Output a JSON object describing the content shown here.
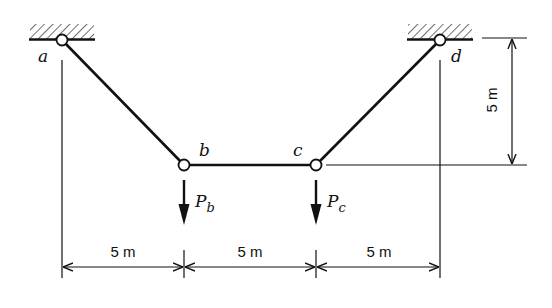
{
  "diagram": {
    "type": "cable-structure",
    "nodes": {
      "a": {
        "label": "a"
      },
      "b": {
        "label": "b"
      },
      "c": {
        "label": "c"
      },
      "d": {
        "label": "d"
      }
    },
    "loads": {
      "pb": {
        "symbol": "P",
        "subscript": "b"
      },
      "pc": {
        "symbol": "P",
        "subscript": "c"
      }
    },
    "dimensions": {
      "span1": "5 m",
      "span2": "5 m",
      "span3": "5 m",
      "height": "5 m"
    }
  }
}
